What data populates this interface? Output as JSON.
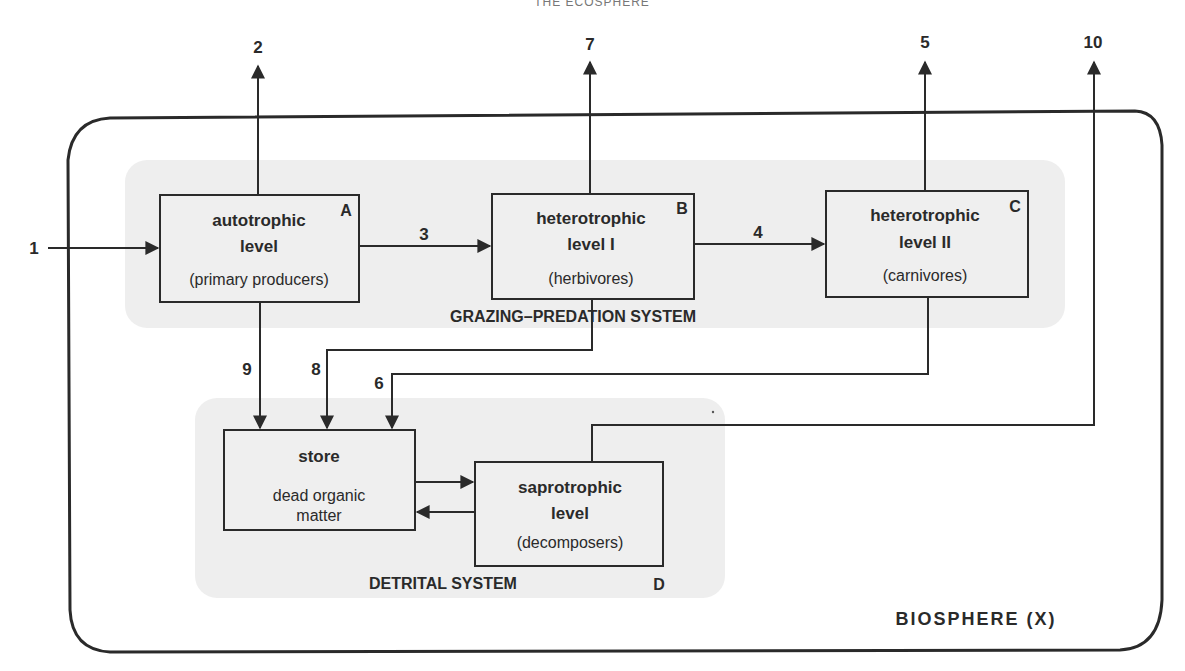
{
  "header": {
    "title": "THE ECOSPHERE"
  },
  "biosphere": {
    "label": "BIOSPHERE (X)"
  },
  "systems": {
    "grazing": {
      "label": "GRAZING–PREDATION  SYSTEM"
    },
    "detrital": {
      "label": "DETRITAL SYSTEM",
      "corner": "D"
    }
  },
  "boxes": {
    "autotrophic": {
      "title1": "autotrophic",
      "title2": "level",
      "sub": "(primary producers)",
      "corner": "A"
    },
    "hetero1": {
      "title1": "heterotrophic",
      "title2": "level  I",
      "sub": "(herbivores)",
      "corner": "B"
    },
    "hetero2": {
      "title1": "heterotrophic",
      "title2": "level  II",
      "sub": "(carnivores)",
      "corner": "C"
    },
    "store": {
      "title1": "store",
      "sub1": "dead organic",
      "sub2": "matter"
    },
    "saprotrophic": {
      "title1": "saprotrophic",
      "title2": "level",
      "sub": "(decomposers)"
    }
  },
  "flows": {
    "f1": "1",
    "f2": "2",
    "f3": "3",
    "f4": "4",
    "f5": "5",
    "f6": "6",
    "f7": "7",
    "f8": "8",
    "f9": "9",
    "f10": "10"
  },
  "colors": {
    "line": "#2a2a2a",
    "region": "#eeeeee",
    "box": "#efefef"
  }
}
